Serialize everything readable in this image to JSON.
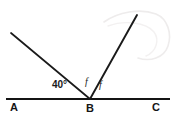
{
  "figure": {
    "type": "geometry-diagram",
    "background_color": "#ffffff",
    "stroke_color": "#1a1a1a",
    "width": 177,
    "height": 117
  },
  "points": {
    "a": {
      "label": "A",
      "x": 6,
      "y": 99,
      "label_x": 10,
      "label_y": 102
    },
    "b": {
      "label": "B",
      "x": 90,
      "y": 99,
      "label_x": 86,
      "label_y": 103
    },
    "c": {
      "label": "C",
      "x": 170,
      "y": 99,
      "label_x": 152,
      "label_y": 102
    },
    "left_ray_tip": {
      "x": 11,
      "y": 33
    },
    "right_ray_tip": {
      "x": 137,
      "y": 15
    }
  },
  "segments": [
    {
      "name": "line-ac",
      "x1": 6,
      "y1": 99,
      "x2": 170,
      "y2": 99,
      "width": 2.1
    },
    {
      "name": "ray-b-upleft",
      "x1": 90,
      "y1": 99,
      "x2": 11,
      "y2": 33,
      "width": 1.7
    },
    {
      "name": "ray-b-upright",
      "x1": 90,
      "y1": 99,
      "x2": 137,
      "y2": 15,
      "width": 1.9
    }
  ],
  "labels": {
    "angle_abd": {
      "text": "40°",
      "x": 52,
      "y": 80
    },
    "angle_f_left": {
      "text": "f",
      "x": 85,
      "y": 77
    },
    "angle_f_right": {
      "text": "f",
      "x": 99,
      "y": 80
    }
  },
  "artifact": {
    "name": "scan-smudge",
    "color": "#eceaea",
    "visible": true
  }
}
